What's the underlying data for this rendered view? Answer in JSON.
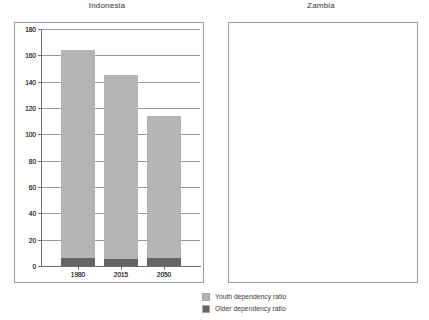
{
  "chart_data": {
    "type": "bar",
    "title": "",
    "subtitle": "",
    "xlabel": "",
    "ylabel": "",
    "ylim": [
      0,
      180
    ],
    "yticks": [
      0,
      20,
      40,
      60,
      80,
      100,
      120,
      140,
      160,
      180
    ],
    "grid": true,
    "stacked": true,
    "legend_position": "bottom-right",
    "legend": [
      "Youth dependency ratio",
      "Older dependency ratio"
    ],
    "colors": {
      "youth": "#b4b4b4",
      "older": "#646464",
      "grid": "#9a9a9a",
      "axis": "#6f6f6f",
      "text": "#3a3a3a",
      "background": "#ffffff"
    },
    "panels": [
      {
        "title": "Indonesia",
        "categories": [
          "1980",
          "2015",
          "2050"
        ],
        "series": [
          {
            "name": "Youth dependency ratio",
            "values": [
              113,
              59,
              39
            ]
          },
          {
            "name": "Older dependency ratio",
            "values": [
              7,
              11,
              33
            ]
          }
        ],
        "totals": [
          120,
          70,
          72
        ]
      },
      {
        "title": "Zambia",
        "categories": [
          "1980",
          "2015",
          "2050"
        ],
        "series": [
          {
            "name": "Youth dependency ratio",
            "values": [
              158,
              140,
              108
            ]
          },
          {
            "name": "Older dependency ratio",
            "values": [
              6,
              5,
              6
            ]
          }
        ],
        "totals": [
          164,
          145,
          114
        ]
      }
    ]
  },
  "panels": [
    {
      "title": "Indonesia",
      "yticks": [
        {
          "label": "180",
          "value": 180
        },
        {
          "label": "160",
          "value": 160
        },
        {
          "label": "140",
          "value": 140
        },
        {
          "label": "120",
          "value": 120
        },
        {
          "label": "100",
          "value": 100
        },
        {
          "label": "80",
          "value": 80
        },
        {
          "label": "60",
          "value": 60
        },
        {
          "label": "40",
          "value": 40
        },
        {
          "label": "20",
          "value": 20
        },
        {
          "label": "0",
          "value": 0
        }
      ],
      "bars": [
        {
          "category": "1980",
          "youth": 113,
          "older": 7
        },
        {
          "category": "2015",
          "youth": 59,
          "older": 11
        },
        {
          "category": "2050",
          "youth": 39,
          "older": 33
        }
      ]
    },
    {
      "title": "Zambia",
      "yticks": [
        {
          "label": "180",
          "value": 180
        },
        {
          "label": "160",
          "value": 160
        },
        {
          "label": "140",
          "value": 140
        },
        {
          "label": "120",
          "value": 120
        },
        {
          "label": "100",
          "value": 100
        },
        {
          "label": "80",
          "value": 80
        },
        {
          "label": "60",
          "value": 60
        },
        {
          "label": "40",
          "value": 40
        },
        {
          "label": "20",
          "value": 20
        },
        {
          "label": "0",
          "value": 0
        }
      ],
      "bars": [
        {
          "category": "1980",
          "youth": 158,
          "older": 6
        },
        {
          "category": "2015",
          "youth": 140,
          "older": 5
        },
        {
          "category": "2050",
          "youth": 108,
          "older": 6
        }
      ]
    }
  ],
  "legend": {
    "items": [
      {
        "label": "Youth dependency ratio",
        "key": "youth"
      },
      {
        "label": "Older dependency ratio",
        "key": "older"
      }
    ]
  }
}
